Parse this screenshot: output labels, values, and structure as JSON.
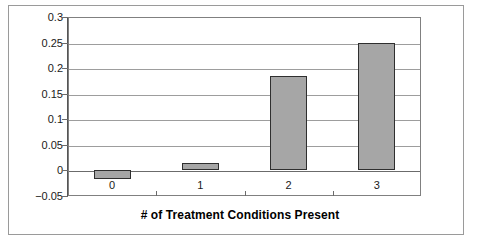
{
  "chart_data": {
    "type": "bar",
    "title": "",
    "subtitle": "",
    "xlabel": "# of Treatment Conditions Present",
    "ylabel": "",
    "categories": [
      "0",
      "1",
      "2",
      "3"
    ],
    "values": [
      -0.017,
      0.015,
      0.185,
      0.25
    ],
    "series": [
      {
        "name": "Effect",
        "values": [
          -0.017,
          0.015,
          0.185,
          0.25
        ]
      }
    ],
    "ylim": [
      -0.05,
      0.3
    ],
    "ytick_labels": [
      "0.3",
      "0.25",
      "0.2",
      "0.15",
      "0.1",
      "0.05",
      "0",
      "-0.05"
    ],
    "ytick_values": [
      0.3,
      0.25,
      0.2,
      0.15,
      0.1,
      0.05,
      0,
      -0.05
    ],
    "grid": true,
    "legend": false,
    "legend_position": "none",
    "bar_color": "#a6a6a6",
    "bar_edge_color": "#2f2f2f",
    "grid_color": "#9d9d9d",
    "axis_color": "#555555",
    "background_color": "#ffffff"
  }
}
